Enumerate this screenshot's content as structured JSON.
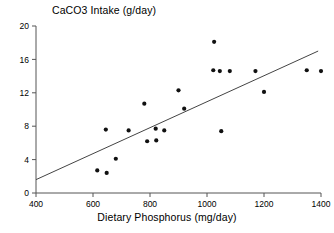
{
  "chart_data": {
    "type": "scatter",
    "title": "CaCO3 Intake (g/day)",
    "xlabel": "Dietary Phosphorus (mg/day)",
    "ylabel": "CaCO3 Intake (g/day)",
    "xlim": [
      400,
      1400
    ],
    "ylim": [
      0,
      20
    ],
    "xticks": [
      400,
      600,
      800,
      1000,
      1200,
      1400
    ],
    "yticks": [
      0,
      4,
      8,
      12,
      16,
      20
    ],
    "grid": false,
    "legend": null,
    "point_color": "#111111",
    "line_color": "#444444",
    "axis_color": "#555555",
    "points": [
      {
        "x": 615,
        "y": 2.7
      },
      {
        "x": 645,
        "y": 7.6
      },
      {
        "x": 648,
        "y": 2.4
      },
      {
        "x": 680,
        "y": 4.1
      },
      {
        "x": 725,
        "y": 7.5
      },
      {
        "x": 780,
        "y": 10.7
      },
      {
        "x": 790,
        "y": 6.2
      },
      {
        "x": 820,
        "y": 7.7
      },
      {
        "x": 822,
        "y": 6.3
      },
      {
        "x": 850,
        "y": 7.5
      },
      {
        "x": 900,
        "y": 12.3
      },
      {
        "x": 920,
        "y": 10.1
      },
      {
        "x": 1025,
        "y": 18.1
      },
      {
        "x": 1022,
        "y": 14.7
      },
      {
        "x": 1045,
        "y": 14.6
      },
      {
        "x": 1050,
        "y": 7.4
      },
      {
        "x": 1080,
        "y": 14.6
      },
      {
        "x": 1170,
        "y": 14.6
      },
      {
        "x": 1200,
        "y": 12.1
      },
      {
        "x": 1350,
        "y": 14.7
      },
      {
        "x": 1400,
        "y": 14.6
      }
    ],
    "trendline": {
      "name": "least-squares fit",
      "x_start": 400,
      "y_start": 1.6,
      "x_end": 1390,
      "y_end": 17.0
    }
  }
}
